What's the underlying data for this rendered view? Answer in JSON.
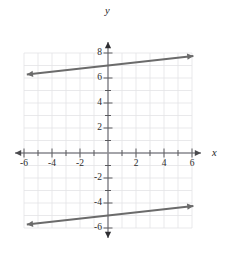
{
  "chart_data": {
    "type": "line",
    "title": "",
    "xlabel": "x",
    "ylabel": "y",
    "xlim": [
      -6,
      6
    ],
    "ylim": [
      -6,
      8
    ],
    "grid": true,
    "grid_step": 1,
    "legend": "none",
    "x_ticks": [
      -6,
      -4,
      -2,
      2,
      4,
      6
    ],
    "y_ticks": [
      8,
      6,
      4,
      2,
      -2,
      -4,
      -6
    ],
    "x_tick_labels": [
      "-6",
      "-4",
      "-2",
      "2",
      "4",
      "6"
    ],
    "y_tick_labels": [
      "8",
      "6",
      "4",
      "2",
      "-2",
      "-4",
      "-6"
    ],
    "tick_step": 2,
    "series": [
      {
        "name": "upper-line",
        "type": "line",
        "slope": 0.125,
        "intercept": 7,
        "equation": "y = 0.125x + 7",
        "arrows": "both",
        "x": [
          -5.8,
          6.1
        ],
        "values": [
          6.28,
          7.76
        ]
      },
      {
        "name": "lower-line",
        "type": "line",
        "slope": 0.125,
        "intercept": -5,
        "equation": "y = 0.125x - 5",
        "arrows": "both",
        "x": [
          -5.8,
          6.1
        ],
        "values": [
          -5.72,
          -4.24
        ]
      }
    ],
    "annotations": []
  },
  "axes": {
    "x_axis_name": "x",
    "y_axis_name": "y",
    "x_axis_arrows": "both",
    "y_axis_arrows": "both"
  },
  "colors": {
    "background": "#ffffff",
    "grid": "#e3e3e6",
    "axis": "#8a8a8f",
    "axis_tick": "#5a5a5e",
    "line": "#6b6b6b",
    "label_text": "#2b2b2b"
  }
}
